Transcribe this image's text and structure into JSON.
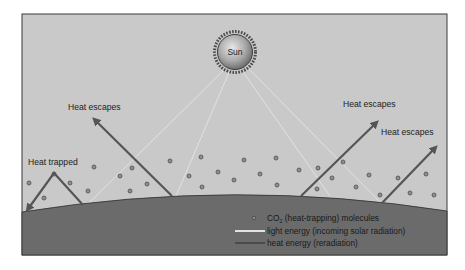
{
  "colors": {
    "sky": "#c9c9c9",
    "ground": "#6b6b6b",
    "frame": "#3a3a3a",
    "heat_arrow": "#555555",
    "light_ray": "#e2e2e2",
    "molecule_fill": "#8f8f8f",
    "molecule_stroke": "#4e4e4e"
  },
  "sun": {
    "label": "Sun",
    "cx": 235,
    "cy": 52,
    "r": 17
  },
  "labels": {
    "heat_trapped": "Heat trapped",
    "heat_escapes_left": "Heat escapes",
    "heat_escapes_right_upper": "Heat escapes",
    "heat_escapes_right_lower": "Heat escapes"
  },
  "legend": {
    "co2_prefix": "CO",
    "co2_subscript": "2",
    "co2_text": " (heat-trapping) molecules",
    "light_energy": "light energy (incoming solar radiation)",
    "heat_energy": "heat energy (reradiation)"
  },
  "light_rays": [
    {
      "x1": 226,
      "y1": 68,
      "x2": 88,
      "y2": 204
    },
    {
      "x1": 230,
      "y1": 70,
      "x2": 176,
      "y2": 196
    },
    {
      "x1": 241,
      "y1": 69,
      "x2": 330,
      "y2": 196
    },
    {
      "x1": 246,
      "y1": 66,
      "x2": 380,
      "y2": 202
    }
  ],
  "heat_arrows": [
    {
      "name": "heat-escapes-arrow-left",
      "path": "M172,196 L95,120"
    },
    {
      "name": "heat-escapes-arrow-right-upper",
      "path": "M301,196 L376,123"
    },
    {
      "name": "heat-escapes-arrow-right-lower",
      "path": "M382,203 L435,148"
    },
    {
      "name": "heat-trapped-arrow",
      "path": "M83,205 L54,173 L28,209"
    }
  ],
  "molecules": [
    [
      29,
      183
    ],
    [
      44,
      198
    ],
    [
      54,
      174
    ],
    [
      70,
      183
    ],
    [
      88,
      191
    ],
    [
      94,
      167
    ],
    [
      120,
      176
    ],
    [
      130,
      191
    ],
    [
      132,
      168
    ],
    [
      147,
      184
    ],
    [
      170,
      161
    ],
    [
      189,
      176
    ],
    [
      201,
      157
    ],
    [
      202,
      187
    ],
    [
      218,
      172
    ],
    [
      234,
      180
    ],
    [
      244,
      160
    ],
    [
      260,
      174
    ],
    [
      276,
      158
    ],
    [
      277,
      185
    ],
    [
      299,
      170
    ],
    [
      317,
      189
    ],
    [
      318,
      168
    ],
    [
      332,
      178
    ],
    [
      343,
      162
    ],
    [
      356,
      187
    ],
    [
      369,
      175
    ],
    [
      380,
      195
    ],
    [
      398,
      178
    ],
    [
      410,
      193
    ],
    [
      426,
      174
    ],
    [
      434,
      195
    ]
  ]
}
